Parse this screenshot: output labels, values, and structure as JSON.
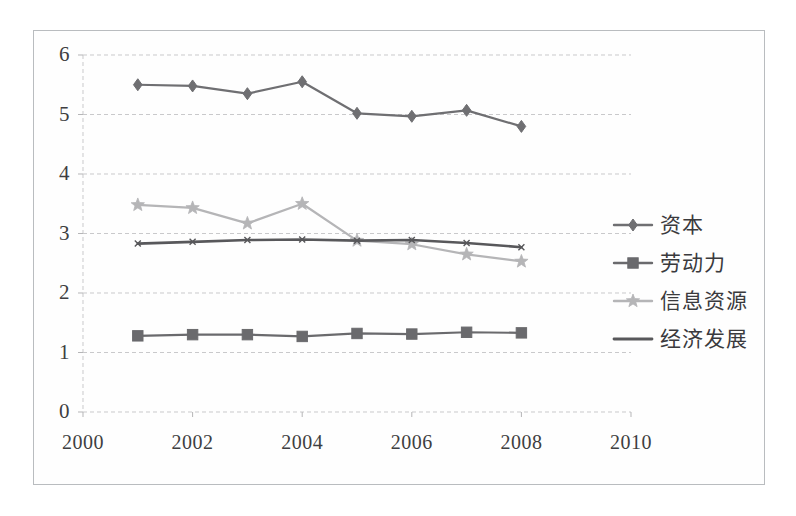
{
  "chart_data": {
    "type": "line",
    "title": "",
    "xlabel": "",
    "ylabel": "",
    "x": [
      2001,
      2002,
      2003,
      2004,
      2005,
      2006,
      2007,
      2008
    ],
    "xlim": [
      2000,
      2010
    ],
    "ylim": [
      0,
      6
    ],
    "xticks": [
      2000,
      2002,
      2004,
      2006,
      2008,
      2010
    ],
    "xtick_labels": [
      "2000",
      "2002",
      "2004",
      "2006",
      "2008",
      "2010"
    ],
    "yticks": [
      0,
      1,
      2,
      3,
      4,
      5,
      6
    ],
    "ytick_labels": [
      "0",
      "1",
      "2",
      "3",
      "4",
      "5",
      "6"
    ],
    "grid": "horizontal-dashed",
    "legend_position": "right",
    "series": [
      {
        "name": "资本",
        "marker": "diamond",
        "color": "#6f6f72",
        "values": [
          5.5,
          5.48,
          5.35,
          5.55,
          5.02,
          4.97,
          5.07,
          4.8
        ]
      },
      {
        "name": "劳动力",
        "marker": "square",
        "color": "#6a6a6d",
        "values": [
          1.28,
          1.3,
          1.3,
          1.27,
          1.32,
          1.31,
          1.34,
          1.33
        ]
      },
      {
        "name": "信息资源",
        "marker": "star",
        "color": "#b5b5b7",
        "values": [
          3.48,
          3.43,
          3.17,
          3.5,
          2.88,
          2.82,
          2.65,
          2.53
        ]
      },
      {
        "name": "经济发展",
        "marker": "line",
        "color": "#58585b",
        "values": [
          2.83,
          2.86,
          2.89,
          2.9,
          2.88,
          2.89,
          2.84,
          2.77
        ]
      }
    ]
  },
  "legend": {
    "items": [
      {
        "label": "资本",
        "marker": "diamond",
        "color": "#6f6f72"
      },
      {
        "label": "劳动力",
        "marker": "square",
        "color": "#6a6a6d"
      },
      {
        "label": "信息资源",
        "marker": "star",
        "color": "#b5b5b7"
      },
      {
        "label": "经济发展",
        "marker": "line",
        "color": "#58585b"
      }
    ]
  },
  "colors": {
    "frame": "#b9bcbf",
    "grid": "#c9c9cb",
    "axis_text": "#3e3e41",
    "background": "#ffffff"
  }
}
